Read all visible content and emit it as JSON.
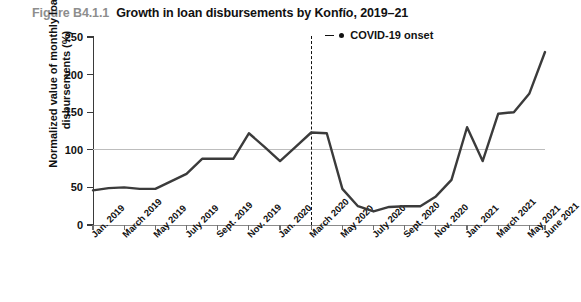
{
  "figure": {
    "number": "Figure B4.1.1",
    "title": "Growth in loan disbursements by Konfío, 2019–21"
  },
  "legend": {
    "items": [
      {
        "label": "COVID-19 onset",
        "marker": "dashed-line-with-dot",
        "color": "#111111"
      }
    ]
  },
  "colors": {
    "series_line": "#3b3b3b",
    "axis": "#3a3a3a",
    "gridline": "#bdbdbd",
    "covid_line": "#111111",
    "figure_number": "#8d8d8d",
    "title": "#111111"
  },
  "chart_data": {
    "type": "line",
    "title": "Growth in loan disbursements by Konfío, 2019–21",
    "xlabel": "",
    "ylabel": "Normalized value of monthly loan disbursements (%)",
    "ylim": [
      0,
      250
    ],
    "yticks": [
      0,
      50,
      100,
      150,
      200,
      250
    ],
    "ytick_labels": [
      "0",
      "50",
      "100",
      "150",
      "200",
      "250"
    ],
    "grid": "horizontal-reference-line-at-100",
    "legend_position": "top-right",
    "x_tick_labels": [
      "Jan. 2019",
      "March 2019",
      "May 2019",
      "July 2019",
      "Sept. 2019",
      "Nov. 2019",
      "Jan. 2020",
      "March 2020",
      "May 2020",
      "July 2020",
      "Sept. 2020",
      "Nov. 2020",
      "Jan. 2021",
      "March 2021",
      "May 2021",
      "June 2021"
    ],
    "x": [
      "Jan. 2019",
      "Feb. 2019",
      "March 2019",
      "April 2019",
      "May 2019",
      "June 2019",
      "July 2019",
      "Aug. 2019",
      "Sept. 2019",
      "Oct. 2019",
      "Nov. 2019",
      "Dec. 2019",
      "Jan. 2020",
      "Feb. 2020",
      "March 2020",
      "April 2020",
      "May 2020",
      "June 2020",
      "July 2020",
      "Aug. 2020",
      "Sept. 2020",
      "Oct. 2020",
      "Nov. 2020",
      "Dec. 2020",
      "Jan. 2021",
      "Feb. 2021",
      "March 2021",
      "April 2021",
      "May 2021",
      "June 2021"
    ],
    "series": [
      {
        "name": "Normalized value of monthly loan disbursements (%)",
        "color": "#3b3b3b",
        "values": [
          46,
          49,
          50,
          48,
          48,
          58,
          68,
          88,
          88,
          88,
          122,
          104,
          85,
          104,
          123,
          122,
          48,
          25,
          18,
          24,
          25,
          25,
          38,
          60,
          130,
          85,
          148,
          150,
          175,
          230
        ]
      }
    ],
    "annotations": [
      {
        "type": "vline",
        "label": "COVID-19 onset",
        "x": "March 2020",
        "style": "dashed",
        "color": "#111111"
      }
    ]
  }
}
